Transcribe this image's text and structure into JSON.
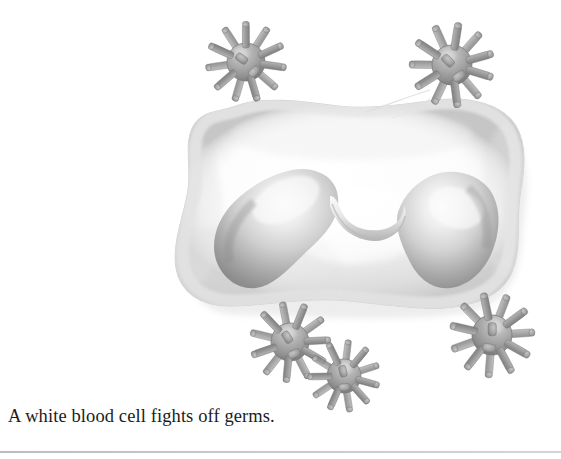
{
  "page": {
    "background_color": "#ffffff",
    "width": 561,
    "height": 459
  },
  "caption": {
    "text": "A white blood cell fights off germs."
  },
  "figure": {
    "title": "A white blood cell fights off germs.",
    "style": "grayscale airbrush textbook illustration",
    "cell": {
      "label": "white blood cell",
      "body_color": "#fbfbfb",
      "rim_color": "#dcdcdc",
      "shadow_color": "#c9c9c9",
      "nucleus_label": "bilobed nucleus",
      "nucleus_light": "#ececec",
      "nucleus_mid": "#c0c0c0",
      "nucleus_dark": "#959595",
      "bounds": {
        "x": 186,
        "y": 98,
        "w": 340,
        "h": 216
      }
    },
    "germs": {
      "label": "germs",
      "count": 5,
      "sphere_light": "#c2c2c2",
      "sphere_mid": "#a2a2a2",
      "sphere_dark": "#7d7d7d",
      "spike_color": "#999999",
      "spike_dark": "#7a7a7a",
      "items": [
        {
          "name": "germ-top-left",
          "cx": 246,
          "cy": 62,
          "r": 19,
          "spike_len": 20,
          "spike_w": 7,
          "spikes": 11,
          "rotation": 8
        },
        {
          "name": "germ-top-right",
          "cx": 452,
          "cy": 65,
          "r": 20,
          "spike_len": 21,
          "spike_w": 7.5,
          "spikes": 11,
          "rotation": 17
        },
        {
          "name": "germ-bottom-left",
          "cx": 290,
          "cy": 342,
          "r": 19,
          "spike_len": 20,
          "spike_w": 7,
          "spikes": 11,
          "rotation": 30
        },
        {
          "name": "germ-bottom-mid",
          "cx": 344,
          "cy": 376,
          "r": 17,
          "spike_len": 18,
          "spike_w": 6.5,
          "spikes": 11,
          "rotation": 48
        },
        {
          "name": "germ-bottom-right",
          "cx": 492,
          "cy": 335,
          "r": 20,
          "spike_len": 21,
          "spike_w": 7.5,
          "spikes": 11,
          "rotation": 62
        }
      ]
    },
    "thread": {
      "label": "faint filament from top-right germ",
      "color": "#d8d8d8"
    }
  },
  "rule": {
    "label": "bottom page rule",
    "color": "#c4c4c4"
  }
}
